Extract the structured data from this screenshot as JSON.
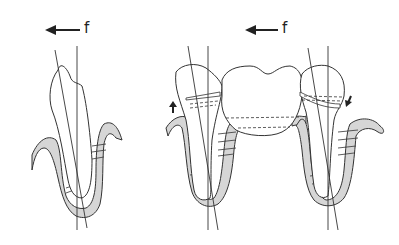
{
  "figure": {
    "type": "dental-biomechanics-diagram",
    "left_panel": {
      "force_label": "f",
      "force_direction": "left",
      "description": "single tooth tipping under lateral force"
    },
    "right_panel": {
      "force_label": "f",
      "force_direction": "left",
      "description": "bridge (pontic) splinting two abutment teeth under lateral force",
      "movement_arrows": [
        "up-left abutment",
        "down-right abutment"
      ]
    },
    "colors": {
      "line": "#333333",
      "bone_fill": "#d6d6d6",
      "tooth_fill": "#ffffff",
      "background": "#ffffff"
    }
  }
}
